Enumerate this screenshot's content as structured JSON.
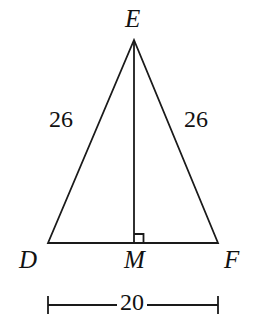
{
  "figure": {
    "kind": "isosceles-triangle-with-altitude",
    "background_color": "#ffffff",
    "stroke_color": "#1a1a1a",
    "text_color": "#111111",
    "vertices": {
      "apex": {
        "label": "E",
        "x": 134,
        "y": 40
      },
      "bottom_left": {
        "label": "D",
        "x": 48,
        "y": 243
      },
      "bottom_right": {
        "label": "F",
        "x": 218,
        "y": 243
      },
      "foot_of_altitude": {
        "label": "M",
        "x": 134,
        "y": 243
      }
    },
    "labels": {
      "apex": "E",
      "bottom_left": "D",
      "bottom_right": "F",
      "midpoint": "M"
    },
    "side_measures": {
      "left_leg": "26",
      "right_leg": "26",
      "base": "20"
    },
    "right_angle": {
      "at": "M",
      "size_px": 9,
      "marked": true
    },
    "dimension_line": {
      "value": "20",
      "from_x": 48,
      "to_x": 218,
      "y": 305,
      "tick_half_height": 9
    }
  }
}
